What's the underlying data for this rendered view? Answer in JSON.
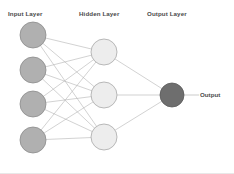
{
  "diagram": {
    "type": "neural-network",
    "background_color": "#ffffff",
    "labels": {
      "input_layer": "Input Layer",
      "hidden_layer": "Hidden Layer",
      "output_layer": "Output Layer",
      "output_signal": "Output"
    },
    "colors": {
      "input_node_fill": "#b0b0b0",
      "input_node_stroke": "#8c8c8c",
      "hidden_node_fill": "#ededed",
      "hidden_node_stroke": "#a8a8a8",
      "output_node_fill": "#6e6e6e",
      "output_node_stroke": "#5a5a5a",
      "edge_stroke": "#b4b4b4",
      "label_text": "#4a4a4a"
    },
    "layers": [
      {
        "name": "input",
        "label": "Input Layer",
        "node_count": 4,
        "nodes": [
          {
            "id": "i1",
            "cx": 33,
            "cy": 35,
            "r": 13
          },
          {
            "id": "i2",
            "cx": 33,
            "cy": 70,
            "r": 13
          },
          {
            "id": "i3",
            "cx": 33,
            "cy": 104,
            "r": 13
          },
          {
            "id": "i4",
            "cx": 33,
            "cy": 140,
            "r": 13
          }
        ]
      },
      {
        "name": "hidden",
        "label": "Hidden Layer",
        "node_count": 3,
        "nodes": [
          {
            "id": "h1",
            "cx": 104,
            "cy": 52,
            "r": 13
          },
          {
            "id": "h2",
            "cx": 104,
            "cy": 95,
            "r": 13
          },
          {
            "id": "h3",
            "cx": 104,
            "cy": 137,
            "r": 13
          }
        ]
      },
      {
        "name": "output",
        "label": "Output Layer",
        "node_count": 1,
        "nodes": [
          {
            "id": "o1",
            "cx": 172,
            "cy": 95,
            "r": 12
          }
        ]
      }
    ],
    "edges": [
      {
        "from": "i1",
        "to": "h1"
      },
      {
        "from": "i1",
        "to": "h2"
      },
      {
        "from": "i1",
        "to": "h3"
      },
      {
        "from": "i2",
        "to": "h1"
      },
      {
        "from": "i2",
        "to": "h2"
      },
      {
        "from": "i2",
        "to": "h3"
      },
      {
        "from": "i3",
        "to": "h1"
      },
      {
        "from": "i3",
        "to": "h2"
      },
      {
        "from": "i3",
        "to": "h3"
      },
      {
        "from": "i4",
        "to": "h1"
      },
      {
        "from": "i4",
        "to": "h2"
      },
      {
        "from": "i4",
        "to": "h3"
      },
      {
        "from": "h1",
        "to": "o1"
      },
      {
        "from": "h2",
        "to": "o1"
      },
      {
        "from": "h3",
        "to": "o1"
      }
    ],
    "output_arrow": {
      "x1": 184,
      "y1": 95,
      "x2": 199,
      "y2": 95
    }
  }
}
